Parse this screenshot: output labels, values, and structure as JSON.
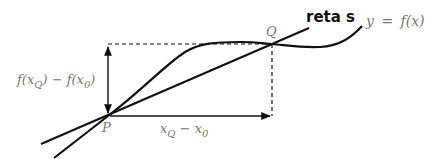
{
  "diagram": {
    "labels": {
      "curve": "y = f(x)",
      "secant_line": "reta s",
      "point_p": "P",
      "point_q": "Q",
      "vertical_difference": "f(x_Q) − f(x_0)",
      "horizontal_difference": "x_Q − x_0"
    },
    "label_parts": {
      "curve_y": "y",
      "curve_eq": "=",
      "curve_f": "f(x)",
      "vd_f1": "f(x",
      "vd_sub1": "Q",
      "vd_mid": ") − f(x",
      "vd_sub2": "0",
      "vd_end": ")",
      "hd_x1": "x",
      "hd_sub1": "Q",
      "hd_mid": " − x",
      "hd_sub2": "0"
    },
    "colors": {
      "stroke": "#111111",
      "label_text": "#777777",
      "background": "#ffffff"
    }
  }
}
